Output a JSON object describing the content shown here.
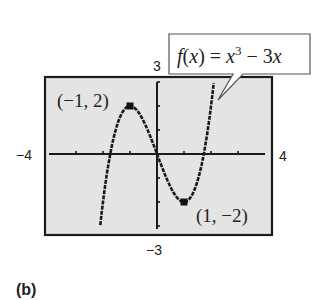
{
  "chart_data": {
    "type": "line",
    "title": "",
    "function": "f(x) = x^3 - 3x",
    "xlabel": "",
    "ylabel": "",
    "xlim": [
      -4,
      4
    ],
    "ylim": [
      -3,
      3
    ],
    "xticks": [
      -4,
      -3,
      -2,
      -1,
      0,
      1,
      2,
      3,
      4
    ],
    "yticks": [
      -3,
      -2,
      -1,
      0,
      1,
      2,
      3
    ],
    "grid": false,
    "series": [
      {
        "name": "f(x) = x^3 - 3x",
        "x": [
          -2.1,
          -2.0,
          -1.75,
          -1.5,
          -1.25,
          -1.0,
          -0.75,
          -0.5,
          -0.25,
          0,
          0.25,
          0.5,
          0.75,
          1.0,
          1.25,
          1.5,
          1.75,
          2.0,
          2.1
        ],
        "y": [
          -2.96,
          -2.0,
          -0.11,
          1.13,
          1.8,
          2.0,
          1.83,
          1.38,
          0.73,
          0,
          -0.73,
          -1.38,
          -1.83,
          -2.0,
          -1.8,
          -1.13,
          0.11,
          2.0,
          2.96
        ]
      }
    ],
    "marked_points": [
      {
        "x": -1,
        "y": 2,
        "label": "(−1, 2)"
      },
      {
        "x": 1,
        "y": -2,
        "label": "(1, −2)"
      }
    ],
    "window_labels": {
      "xmin": "−4",
      "xmax": "4",
      "ymin": "−3",
      "ymax": "3"
    },
    "annotation": {
      "prefix": "f",
      "paren_open": "(",
      "var": "x",
      "mid": ") = ",
      "var2": "x",
      "exp": "3",
      "suffix": " − 3",
      "var3": "x"
    },
    "panel_label": "(b)",
    "colors": {
      "screen_bg": "#e4e4e4",
      "ink": "#1a1a1a"
    }
  }
}
